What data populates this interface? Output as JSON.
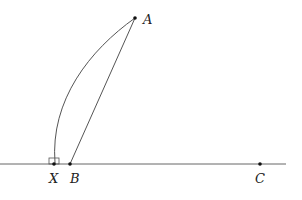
{
  "diagram": {
    "points": {
      "A": {
        "label": "A",
        "x": 135,
        "y": 18
      },
      "X": {
        "label": "X",
        "x": 54,
        "y": 164
      },
      "B": {
        "label": "B",
        "x": 70,
        "y": 164
      },
      "C": {
        "label": "C",
        "x": 260,
        "y": 164
      }
    },
    "line_BC": {
      "x1": 0,
      "x2": 286,
      "y": 164
    },
    "segments": [
      [
        "A",
        "B"
      ]
    ],
    "arcs": [
      [
        "A",
        "X"
      ]
    ],
    "right_angle_marker_at": "X",
    "colors": {
      "stroke": "#555555",
      "point": "#111111",
      "text": "#222222"
    }
  }
}
